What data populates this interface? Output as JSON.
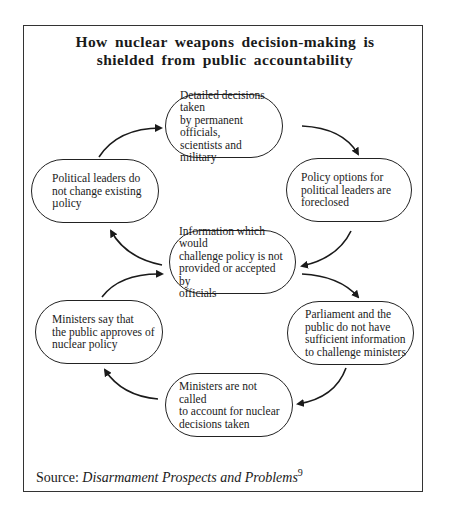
{
  "title": {
    "line1": "How nuclear weapons decision-making is",
    "line2": "shielded from public accountability"
  },
  "nodes": [
    {
      "id": "top",
      "lines": [
        "Detailed decisions taken",
        "by permanent officials,",
        "scientists and military"
      ]
    },
    {
      "id": "right-top",
      "lines": [
        "Policy options for",
        "political leaders are",
        "foreclosed"
      ]
    },
    {
      "id": "center",
      "lines": [
        "Information which would",
        "challenge policy is not",
        "provided or accepted by",
        "officials"
      ]
    },
    {
      "id": "left-top",
      "lines": [
        "Political leaders do",
        "not change existing",
        "µolicy"
      ]
    },
    {
      "id": "right-bottom",
      "lines": [
        "Parliament and the",
        "public do not have",
        "sufficient information",
        "to challenge ministers"
      ]
    },
    {
      "id": "bottom",
      "lines": [
        "Ministers are not called",
        "to account for nuclear",
        "decisions taken"
      ]
    },
    {
      "id": "left-bottom",
      "lines": [
        "Ministers say that",
        "the public approves of",
        "nuclear policy"
      ]
    }
  ],
  "edges": [
    {
      "from": "left-top",
      "to": "top"
    },
    {
      "from": "top",
      "to": "right-top"
    },
    {
      "from": "right-top",
      "to": "center"
    },
    {
      "from": "center",
      "to": "left-top"
    },
    {
      "from": "left-bottom",
      "to": "center"
    },
    {
      "from": "center",
      "to": "right-bottom"
    },
    {
      "from": "right-bottom",
      "to": "bottom"
    },
    {
      "from": "bottom",
      "to": "left-bottom"
    }
  ],
  "source": {
    "label": "Source:",
    "title": "Disarmament Prospects and Problems",
    "footnote": "9"
  }
}
